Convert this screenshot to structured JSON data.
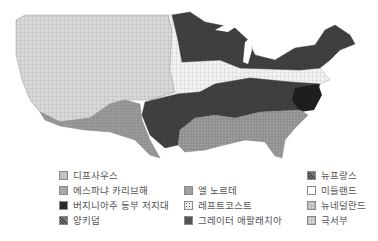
{
  "map": {
    "title": "",
    "regions": [
      {
        "id": "west",
        "label": "디프사우스",
        "fill": "#d6d6d6"
      },
      {
        "id": "southwest",
        "label": "에스파냐 카리브해",
        "fill": "#9a9a9a"
      },
      {
        "id": "upper-north",
        "label": "버지니아주 동부 저지대",
        "fill": "#3a3a3a"
      },
      {
        "id": "midland-band",
        "label": "미들랜드",
        "fill": "#ececec"
      },
      {
        "id": "appalachia",
        "label": "그레이터 애팔래치아",
        "fill": "#4a4a4a"
      },
      {
        "id": "deep-south",
        "label": "양키덤",
        "fill": "#8c8c8c"
      },
      {
        "id": "tidewater",
        "label": "뉴프랑스",
        "fill": "#222222"
      }
    ]
  },
  "legend": {
    "columns": [
      [
        {
          "label": "디프사우스",
          "swatch": "#c9c9c9",
          "pattern": "grid"
        },
        {
          "label": "에스파냐 카리브해",
          "swatch": "#a8a8a8",
          "pattern": "none"
        },
        {
          "label": "버지니아주 동부 저지대",
          "swatch": "#2a2a2a",
          "pattern": "none"
        },
        {
          "label": "양키덤",
          "swatch": "#6f6f6f",
          "pattern": "dense"
        }
      ],
      [
        {
          "label": "엘 노르테",
          "swatch": "#a0a0a0",
          "pattern": "none"
        },
        {
          "label": "레프트코스트",
          "swatch": "#e8e8e8",
          "pattern": "dots"
        },
        {
          "label": "그레이터 애팔래치아",
          "swatch": "#555555",
          "pattern": "none"
        }
      ],
      [
        {
          "label": "뉴프랑스",
          "swatch": "#5a5a5a",
          "pattern": "dense"
        },
        {
          "label": "미들랜드",
          "swatch": "#ffffff",
          "pattern": "none"
        },
        {
          "label": "뉴네덜란드",
          "swatch": "#d0d0d0",
          "pattern": "grid"
        },
        {
          "label": "극서부",
          "swatch": "#dcdcdc",
          "pattern": "grid"
        }
      ]
    ]
  }
}
